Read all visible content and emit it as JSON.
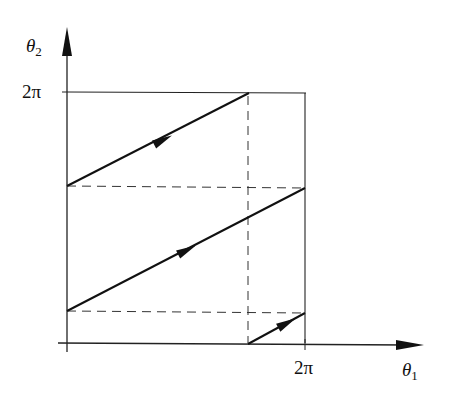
{
  "diagram": {
    "type": "torus-flow-phase-plane",
    "axes": {
      "x": {
        "symbol": "θ",
        "subscript": "1",
        "tick_label": "2π"
      },
      "y": {
        "symbol": "θ",
        "subscript": "2",
        "tick_label": "2π"
      }
    },
    "colors": {
      "stroke": "#1a1a1a",
      "background": "#ffffff"
    },
    "trajectory_segments": 3,
    "dashed_guides": {
      "horizontal": 2,
      "vertical": 1
    }
  }
}
